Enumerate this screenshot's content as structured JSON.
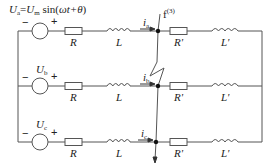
{
  "diagram": {
    "type": "three-phase circuit with three-phase short-circuit fault",
    "source_a": {
      "label_main": "U",
      "label_sub": "a",
      "equation": {
        "lhs_main": "U",
        "lhs_sub": "a",
        "eq": "=",
        "rhs_main": "U",
        "rhs_sub": "m",
        "func": " sin(",
        "arg": "ωt+θ",
        "close": ")"
      }
    },
    "source_b": {
      "label_main": "U",
      "label_sub": "b"
    },
    "source_c": {
      "label_main": "U",
      "label_sub": "c"
    },
    "polarity": {
      "minus": "−",
      "plus": "+"
    },
    "elements": {
      "resistor": "R",
      "inductor": "L",
      "resistor_prime": "R'",
      "inductor_prime": "L'"
    },
    "currents": [
      {
        "main": "i",
        "sub": "a"
      },
      {
        "main": "i",
        "sub": "b"
      },
      {
        "main": "i",
        "sub": "c"
      }
    ],
    "fault": {
      "main": "f",
      "sup": "(3)"
    },
    "colors": {
      "line": "#555555",
      "text": "#222222",
      "node": "#111111"
    }
  }
}
